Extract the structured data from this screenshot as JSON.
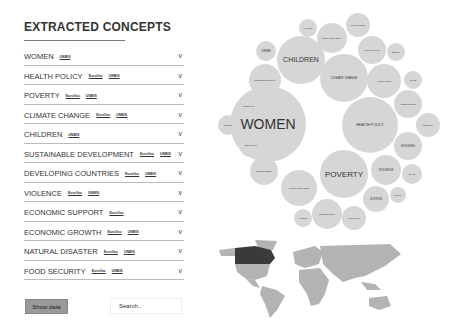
{
  "header": {
    "title": "EXTRACTED CONCEPTS"
  },
  "concepts": [
    {
      "name": "WOMEN",
      "tags": [
        "UNBIS"
      ]
    },
    {
      "name": "HEALTH POLICY",
      "tags": [
        "EuroVoc",
        "UNBIS"
      ]
    },
    {
      "name": "POVERTY",
      "tags": [
        "EuroVoc",
        "UNBIS"
      ]
    },
    {
      "name": "CLIMATE CHANGE",
      "tags": [
        "EuroVoc",
        "UNBIS"
      ]
    },
    {
      "name": "CHILDREN",
      "tags": [
        "UNBIS"
      ]
    },
    {
      "name": "SUSTAINABLE DEVELOPMENT",
      "tags": [
        "EuroVoc",
        "UNBIS"
      ]
    },
    {
      "name": "DEVELOPING COUNTRIES",
      "tags": [
        "EuroVoc",
        "UNBIS"
      ]
    },
    {
      "name": "VIOLENCE",
      "tags": [
        "EuroVoc",
        "UNBIS"
      ]
    },
    {
      "name": "ECONOMIC SUPPORT",
      "tags": [
        "EuroVoc"
      ]
    },
    {
      "name": "ECONOMIC GROWTH",
      "tags": [
        "EuroVoc",
        "UNBIS"
      ]
    },
    {
      "name": "NATURAL DISASTER",
      "tags": [
        "EuroVoc",
        "UNBIS"
      ]
    },
    {
      "name": "FOOD SECURITY",
      "tags": [
        "EuroVoc",
        "UNBIS"
      ]
    }
  ],
  "chevron": "v",
  "controls": {
    "show_data_label": "Show data",
    "search_placeholder": "Search.."
  },
  "bubbles": [
    {
      "label": "WOMEN",
      "cx": 268,
      "cy": 124,
      "r": 38,
      "fs": 14
    },
    {
      "label": "CHILDREN",
      "cx": 301,
      "cy": 60,
      "r": 24,
      "fs": 7
    },
    {
      "label": "CLIMATE CHANGE",
      "cx": 344,
      "cy": 78,
      "r": 24,
      "fs": 3
    },
    {
      "label": "HEALTH POLICY",
      "cx": 370,
      "cy": 125,
      "r": 28,
      "fs": 3.5
    },
    {
      "label": "POVERTY",
      "cx": 344,
      "cy": 174,
      "r": 24,
      "fs": 8
    },
    {
      "label": "CRIME",
      "cx": 266,
      "cy": 51,
      "r": 10,
      "fs": 3
    },
    {
      "label": "ECONOMIC GROWTH",
      "cx": 265,
      "cy": 80,
      "r": 16,
      "fs": 2
    },
    {
      "label": "INEQUALITY",
      "cx": 249,
      "cy": 106,
      "r": 11,
      "fs": 2
    },
    {
      "label": "CITIZEN",
      "cx": 228,
      "cy": 125,
      "r": 10,
      "fs": 2
    },
    {
      "label": "EDUCATION",
      "cx": 251,
      "cy": 145,
      "r": 12,
      "fs": 2
    },
    {
      "label": "DEVELOPMENT",
      "cx": 264,
      "cy": 171,
      "r": 14,
      "fs": 2
    },
    {
      "label": "NATURAL DISASTER",
      "cx": 299,
      "cy": 188,
      "r": 18,
      "fs": 2
    },
    {
      "label": "FOOD SECURITY",
      "cx": 327,
      "cy": 214,
      "r": 15,
      "fs": 2
    },
    {
      "label": "MIGRATION",
      "cx": 354,
      "cy": 218,
      "r": 12,
      "fs": 2
    },
    {
      "label": "LABOUR",
      "cx": 303,
      "cy": 218,
      "r": 9,
      "fs": 2
    },
    {
      "label": "JUSTICE",
      "cx": 376,
      "cy": 199,
      "r": 13,
      "fs": 3
    },
    {
      "label": "VIOLENCE",
      "cx": 386,
      "cy": 170,
      "r": 15,
      "fs": 3
    },
    {
      "label": "HOUSING",
      "cx": 408,
      "cy": 146,
      "r": 14,
      "fs": 3
    },
    {
      "label": "CONSUMPTION",
      "cx": 408,
      "cy": 104,
      "r": 14,
      "fs": 2
    },
    {
      "label": "EMPLOYMENT",
      "cx": 358,
      "cy": 25,
      "r": 12,
      "fs": 2
    },
    {
      "label": "EDUCATION POLICY",
      "cx": 332,
      "cy": 38,
      "r": 15,
      "fs": 2
    },
    {
      "label": "FINANCE",
      "cx": 308,
      "cy": 28,
      "r": 9,
      "fs": 2
    },
    {
      "label": "HUMAN RIGHTS",
      "cx": 372,
      "cy": 50,
      "r": 14,
      "fs": 2
    },
    {
      "label": "ENERGY",
      "cx": 396,
      "cy": 52,
      "r": 9,
      "fs": 2
    },
    {
      "label": "AGRICULTURE",
      "cx": 384,
      "cy": 81,
      "r": 17,
      "fs": 2
    },
    {
      "label": "TRADE",
      "cx": 413,
      "cy": 80,
      "r": 9,
      "fs": 2
    },
    {
      "label": "SECURITY",
      "cx": 428,
      "cy": 125,
      "r": 12,
      "fs": 2
    },
    {
      "label": "PEACE",
      "cx": 412,
      "cy": 174,
      "r": 10,
      "fs": 2
    },
    {
      "label": "HEALTH",
      "cx": 398,
      "cy": 195,
      "r": 8,
      "fs": 2
    }
  ],
  "colors": {
    "bubble": "#d6d6d6",
    "map_land": "#b3b3b3",
    "map_highlight": "#3a3a3a"
  },
  "map": {
    "highlighted_country": "Canada"
  }
}
